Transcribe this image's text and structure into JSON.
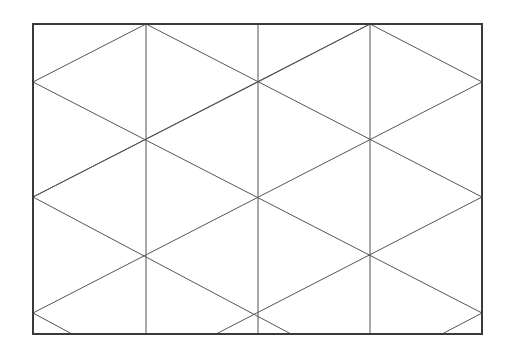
{
  "diagram": {
    "type": "triangular-lattice-in-rectangle",
    "canvas": {
      "width": 512,
      "height": 358,
      "background": "#ffffff"
    },
    "frame": {
      "x": 33,
      "y": 24,
      "width": 449,
      "height": 310,
      "stroke": "#3a3a3a",
      "stroke_width": 2
    },
    "line_style": {
      "stroke": "#555555",
      "stroke_width": 1
    },
    "vertical_lines": [
      {
        "x": 146,
        "y1": 24,
        "y2": 334
      },
      {
        "x": 258,
        "y1": 24,
        "y2": 334
      },
      {
        "x": 370,
        "y1": 24,
        "y2": 334
      }
    ],
    "diagonal_lines": [
      {
        "x1": 33,
        "y1": 82,
        "x2": 146,
        "y2": 24
      },
      {
        "x1": 146,
        "y1": 24,
        "x2": 482,
        "y2": 197
      },
      {
        "x1": 33,
        "y1": 82,
        "x2": 482,
        "y2": 313
      },
      {
        "x1": 33,
        "y1": 197,
        "x2": 291,
        "y2": 334
      },
      {
        "x1": 33,
        "y1": 313,
        "x2": 72,
        "y2": 334
      },
      {
        "x1": 258,
        "y1": 82,
        "x2": 370,
        "y2": 24
      },
      {
        "x1": 370,
        "y1": 24,
        "x2": 482,
        "y2": 82
      },
      {
        "x1": 33,
        "y1": 197,
        "x2": 370,
        "y2": 24
      },
      {
        "x1": 33,
        "y1": 313,
        "x2": 482,
        "y2": 82
      },
      {
        "x1": 216,
        "y1": 334,
        "x2": 482,
        "y2": 197
      },
      {
        "x1": 442,
        "y1": 334,
        "x2": 482,
        "y2": 313
      },
      {
        "x1": 33,
        "y1": 197,
        "x2": 33,
        "y2": 197
      },
      {
        "x1": 258,
        "y1": 82,
        "x2": 33,
        "y2": 197
      }
    ],
    "vertices": [
      [
        146,
        24
      ],
      [
        258,
        24
      ],
      [
        370,
        24
      ],
      [
        33,
        82
      ],
      [
        258,
        82
      ],
      [
        482,
        82
      ],
      [
        146,
        140
      ],
      [
        370,
        140
      ],
      [
        33,
        197
      ],
      [
        258,
        197
      ],
      [
        482,
        197
      ],
      [
        146,
        256
      ],
      [
        370,
        256
      ],
      [
        33,
        313
      ],
      [
        258,
        313
      ],
      [
        482,
        313
      ]
    ]
  }
}
